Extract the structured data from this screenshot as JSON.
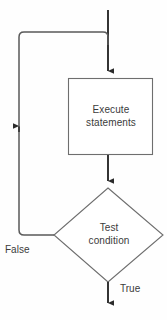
{
  "diagram": {
    "type": "flowchart",
    "background_color": "#fefefe",
    "shape_stroke_color": "#6e6e6e",
    "connector_color": "#2b2b2b",
    "loop_connector_color": "#5a5a5a",
    "text_color": "#3b3b3b",
    "nodes": [
      {
        "id": "execute",
        "shape": "rectangle",
        "label": "Execute\nstatements",
        "line1": "Execute",
        "line2": "statements"
      },
      {
        "id": "test",
        "shape": "diamond",
        "label": "Test\ncondition",
        "line1": "Test",
        "line2": "condition"
      }
    ],
    "edges": [
      {
        "id": "entry",
        "from": "start",
        "to": "execute",
        "label": "",
        "direction": "down"
      },
      {
        "id": "execute-to-test",
        "from": "execute",
        "to": "test",
        "label": "",
        "direction": "down"
      },
      {
        "id": "false-loop",
        "from": "test",
        "to": "execute",
        "label": "False",
        "direction": "up"
      },
      {
        "id": "true-exit",
        "from": "test",
        "to": "end",
        "label": "True",
        "direction": "down"
      }
    ]
  }
}
